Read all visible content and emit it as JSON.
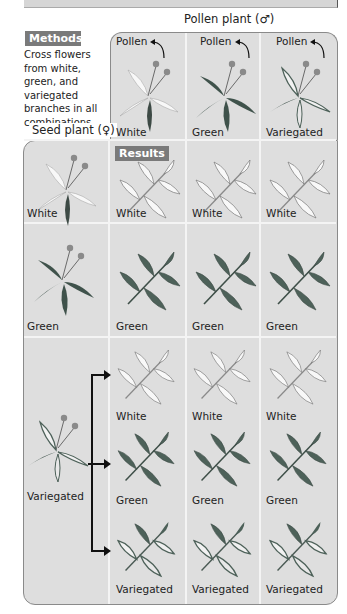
{
  "header": {
    "pollen_plant_label": "Pollen plant (♂)",
    "seed_plant_label": "Seed plant (♀)"
  },
  "methods": {
    "badge": "Methods",
    "text": "Cross flowers from white, green, and variegated branches in all combinations."
  },
  "results": {
    "badge": "Results"
  },
  "pollen_columns": [
    {
      "pollen_label": "Pollen",
      "type": "White",
      "icon": "white-flower-branch"
    },
    {
      "pollen_label": "Pollen",
      "type": "Green",
      "icon": "green-flower-branch"
    },
    {
      "pollen_label": "Pollen",
      "type": "Variegated",
      "icon": "variegated-flower-branch"
    }
  ],
  "seed_rows": [
    {
      "type": "White",
      "offspring": [
        [
          "White",
          "White",
          "White"
        ]
      ]
    },
    {
      "type": "Green",
      "offspring": [
        [
          "Green",
          "Green",
          "Green"
        ]
      ]
    },
    {
      "type": "Variegated",
      "offspring": [
        [
          "White",
          "White",
          "White"
        ],
        [
          "Green",
          "Green",
          "Green"
        ],
        [
          "Variegated",
          "Variegated",
          "Variegated"
        ]
      ]
    }
  ],
  "colors": {
    "panel_bg": "#dedede",
    "badge_bg": "#7a7a7a",
    "grid_line": "#f4f4f4",
    "green_leaf": "#4a6058",
    "white_leaf": "#f6f6f6"
  }
}
